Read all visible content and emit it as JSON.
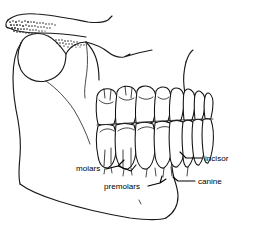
{
  "figure": {
    "background_color": "#ffffff",
    "line_color": "#1a1a1a",
    "text_color": "#000000",
    "width": 253,
    "height": 252
  },
  "labels": [
    {
      "id": "molars",
      "text": "molars",
      "x": 76,
      "y": 171,
      "anchor": "start",
      "leader": "M106,169 L118,166 L124,160 M118,166 L131,171 L136,165"
    },
    {
      "id": "premolars",
      "text": "premolars",
      "x": 104,
      "y": 189,
      "anchor": "start",
      "leader": "M148,186 L160,183 L162,176 M160,183 L166,179"
    },
    {
      "id": "incisor",
      "text": "incisor",
      "x": 205,
      "y": 161,
      "anchor": "start",
      "leader": "M202,158 L186,158 L180,152"
    },
    {
      "id": "canine",
      "text": "canine",
      "x": 198,
      "y": 184,
      "anchor": "start",
      "leader": "M195,181 L178,181 L173,177"
    }
  ],
  "anatomy": {
    "regions": [
      {
        "id": "zygomatic-arch",
        "name": "zygomatic arch",
        "shaded": true
      },
      {
        "id": "coronoid-process",
        "name": "coronoid process",
        "shaded": false
      },
      {
        "id": "mandibular-ramus",
        "name": "mandibular ramus",
        "shaded": false
      },
      {
        "id": "mandibular-body",
        "name": "mandibular body",
        "shaded": false
      },
      {
        "id": "maxilla",
        "name": "maxilla",
        "shaded": false
      },
      {
        "id": "mandibular-notch",
        "name": "mandibular notch",
        "shaded": false
      }
    ],
    "upper_tooth_count": 8,
    "lower_tooth_count": 8
  }
}
